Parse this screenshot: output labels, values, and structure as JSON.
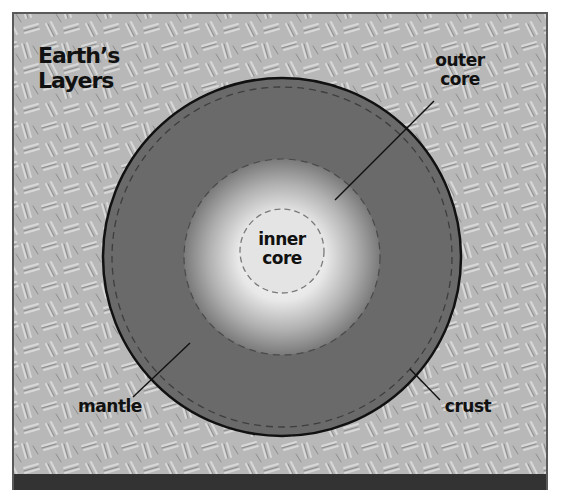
{
  "title": {
    "line1": "Earth’s",
    "line2": "Layers"
  },
  "layers": [
    {
      "name": "inner core",
      "line1": "inner",
      "line2": "core"
    },
    {
      "name": "outer core",
      "line1": "outer",
      "line2": "core"
    },
    {
      "name": "mantle",
      "line1": "mantle"
    },
    {
      "name": "crust",
      "line1": "crust"
    }
  ],
  "colors": {
    "background_texture": "#b4b4b4",
    "mantle": "#6a6a6a",
    "outer_core_edge": "#7a7a7a",
    "inner_core": "#e6e6e6",
    "outline": "#111111",
    "bottom_band": "#333333"
  }
}
